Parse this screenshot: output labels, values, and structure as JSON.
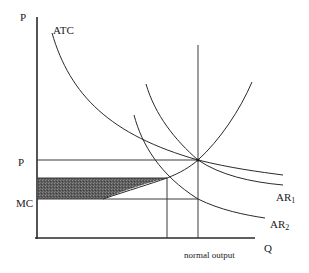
{
  "diagram": {
    "type": "economics-cost-revenue-diagram",
    "axes": {
      "y_label": "P",
      "x_label": "Q"
    },
    "curves": [
      {
        "id": "atc",
        "label": "ATC"
      },
      {
        "id": "mc",
        "label": "MC (rising cost curve)"
      },
      {
        "id": "ar1",
        "label_base": "AR",
        "label_sub": "1"
      },
      {
        "id": "ar2",
        "label_base": "AR",
        "label_sub": "2"
      }
    ],
    "y_levels": [
      {
        "id": "p",
        "label": "P"
      },
      {
        "id": "mc",
        "label": "MC"
      }
    ],
    "x_markers": [
      {
        "id": "normal-output",
        "label": "normal output"
      }
    ],
    "shaded_region": {
      "description": "shaded area between MC level and upper level",
      "color": "#555555"
    },
    "colors": {
      "line": "#2a2a2a",
      "shade": "#5a5a5a",
      "background": "#ffffff"
    }
  }
}
